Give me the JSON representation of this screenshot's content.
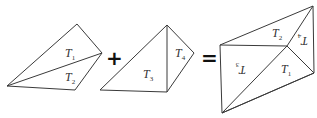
{
  "diagram": {
    "type": "polygon-decomposition",
    "operators": {
      "plus": "+",
      "equals": "="
    },
    "shapes": [
      {
        "id": "quad-1",
        "triangles": [
          {
            "label": "T",
            "sub": "1",
            "rotated": false
          },
          {
            "label": "T",
            "sub": "2",
            "rotated": false
          }
        ]
      },
      {
        "id": "quad-2",
        "triangles": [
          {
            "label": "T",
            "sub": "3",
            "rotated": false
          },
          {
            "label": "T",
            "sub": "4",
            "rotated": false
          }
        ]
      },
      {
        "id": "combined",
        "triangles": [
          {
            "label": "T",
            "sub": "2",
            "rotated": false
          },
          {
            "label": "T",
            "sub": "4",
            "rotated": true
          },
          {
            "label": "T",
            "sub": "3",
            "rotated": true
          },
          {
            "label": "T",
            "sub": "1",
            "rotated": false
          }
        ]
      }
    ]
  }
}
